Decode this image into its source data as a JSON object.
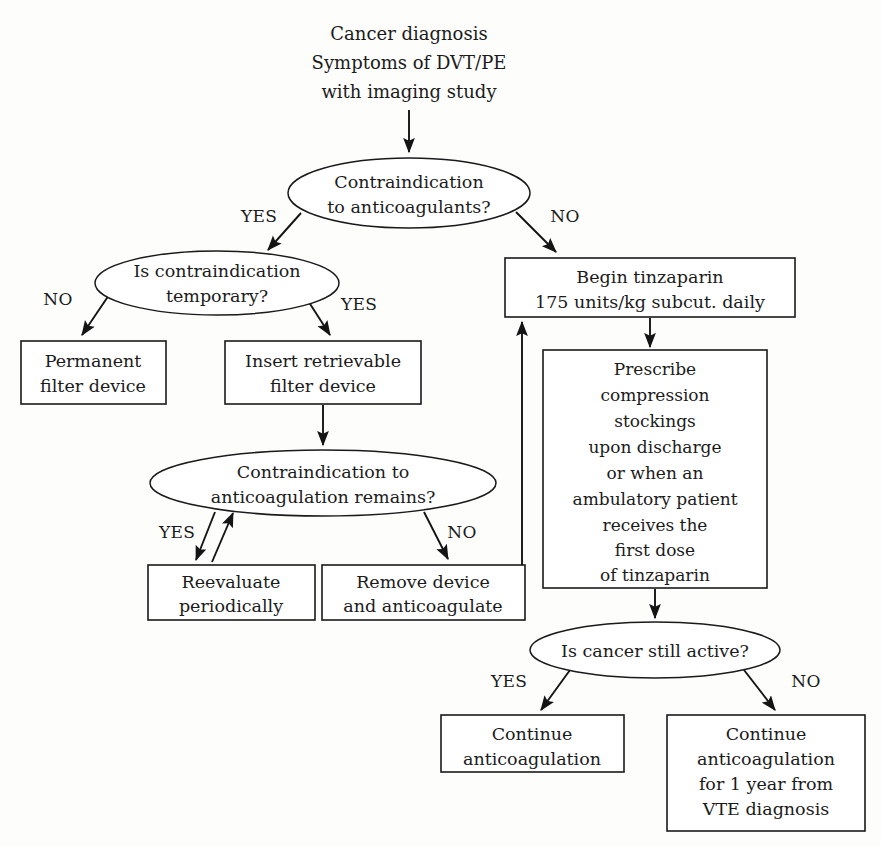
{
  "diagram": {
    "type": "flowchart",
    "colors": {
      "background": "#fdfdfc",
      "stroke": "#141414",
      "node_fill": "#ffffff",
      "text": "#1b1b1b"
    },
    "start": {
      "id": "start",
      "shape": "text",
      "lines": [
        "Cancer diagnosis",
        "Symptoms of DVT/PE",
        "with imaging study"
      ]
    },
    "nodes": [
      {
        "id": "d1",
        "shape": "ellipse",
        "lines": [
          "Contraindication",
          "to anticoagulants?"
        ]
      },
      {
        "id": "d2",
        "shape": "ellipse",
        "lines": [
          "Is contraindication",
          "temporary?"
        ]
      },
      {
        "id": "b_permanent",
        "shape": "box",
        "lines": [
          "Permanent",
          "filter device"
        ]
      },
      {
        "id": "b_retrievable",
        "shape": "box",
        "lines": [
          "Insert retrievable",
          "filter device"
        ]
      },
      {
        "id": "d3",
        "shape": "ellipse",
        "lines": [
          "Contraindication to",
          "anticoagulation remains?"
        ]
      },
      {
        "id": "b_reevaluate",
        "shape": "box",
        "lines": [
          "Reevaluate",
          "periodically"
        ]
      },
      {
        "id": "b_remove",
        "shape": "box",
        "lines": [
          "Remove device",
          "and anticoagulate"
        ]
      },
      {
        "id": "b_tinzaparin",
        "shape": "box",
        "lines": [
          "Begin tinzaparin",
          "175 units/kg subcut. daily"
        ]
      },
      {
        "id": "b_prescribe",
        "shape": "box",
        "lines": [
          "Prescribe",
          "compression",
          "stockings",
          "upon discharge",
          "or when an",
          "ambulatory patient",
          "receives the",
          "first dose",
          "of tinzaparin"
        ]
      },
      {
        "id": "d4",
        "shape": "ellipse",
        "lines": [
          "Is cancer still active?"
        ]
      },
      {
        "id": "b_continue",
        "shape": "box",
        "lines": [
          "Continue",
          "anticoagulation"
        ]
      },
      {
        "id": "b_continue_year",
        "shape": "box",
        "lines": [
          "Continue",
          "anticoagulation",
          "for 1 year from",
          "VTE diagnosis"
        ]
      }
    ],
    "branch_labels": {
      "d1_yes": "YES",
      "d1_no": "NO",
      "d2_no": "NO",
      "d2_yes": "YES",
      "d3_yes": "YES",
      "d3_no": "NO",
      "d4_yes": "YES",
      "d4_no": "NO"
    },
    "edges": [
      {
        "from": "start",
        "to": "d1",
        "label": ""
      },
      {
        "from": "d1",
        "to": "d2",
        "label": "YES"
      },
      {
        "from": "d1",
        "to": "b_tinzaparin",
        "label": "NO"
      },
      {
        "from": "d2",
        "to": "b_permanent",
        "label": "NO"
      },
      {
        "from": "d2",
        "to": "b_retrievable",
        "label": "YES"
      },
      {
        "from": "b_retrievable",
        "to": "d3",
        "label": ""
      },
      {
        "from": "d3",
        "to": "b_reevaluate",
        "label": "YES"
      },
      {
        "from": "b_reevaluate",
        "to": "d3",
        "label": ""
      },
      {
        "from": "d3",
        "to": "b_remove",
        "label": "NO"
      },
      {
        "from": "b_remove",
        "to": "b_tinzaparin",
        "label": ""
      },
      {
        "from": "b_tinzaparin",
        "to": "b_prescribe",
        "label": ""
      },
      {
        "from": "b_prescribe",
        "to": "d4",
        "label": ""
      },
      {
        "from": "d4",
        "to": "b_continue",
        "label": "YES"
      },
      {
        "from": "d4",
        "to": "b_continue_year",
        "label": "NO"
      }
    ]
  }
}
